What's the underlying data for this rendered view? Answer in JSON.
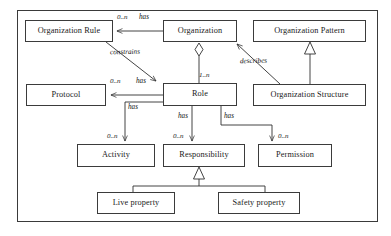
{
  "diagram": {
    "frame": {
      "stroke": "#3a3a3a"
    },
    "node_stroke": "#3b3b3b",
    "text_color": "#1a1a1a",
    "nodes": [
      {
        "id": "organization-rule",
        "label": "Organization Rule"
      },
      {
        "id": "organization",
        "label": "Organization"
      },
      {
        "id": "organization-pattern",
        "label": "Organization Pattern"
      },
      {
        "id": "protocol",
        "label": "Protocol"
      },
      {
        "id": "role",
        "label": "Role"
      },
      {
        "id": "organization-structure",
        "label": "Organization Structure"
      },
      {
        "id": "activity",
        "label": "Activity"
      },
      {
        "id": "responsibility",
        "label": "Responsibility"
      },
      {
        "id": "permission",
        "label": "Permission"
      },
      {
        "id": "live-property",
        "label": "Live property"
      },
      {
        "id": "safety-property",
        "label": "Safety property"
      }
    ],
    "edges": [
      {
        "id": "organization-has-organization-rule",
        "from": "organization",
        "to": "organization-rule",
        "label": "has",
        "multiplicity": "0..n",
        "kind": "association"
      },
      {
        "id": "organization-rule-constrains-role",
        "from": "organization-rule",
        "to": "role",
        "label": "constrains",
        "multiplicity": "",
        "kind": "association"
      },
      {
        "id": "organization-aggregates-role",
        "from": "organization",
        "to": "role",
        "label": "",
        "multiplicity": "1..n",
        "kind": "aggregation"
      },
      {
        "id": "role-has-protocol",
        "from": "role",
        "to": "protocol",
        "label": "has",
        "multiplicity": "0..n",
        "kind": "association"
      },
      {
        "id": "role-has-activity",
        "from": "role",
        "to": "activity",
        "label": "has",
        "multiplicity": "0..n",
        "kind": "association"
      },
      {
        "id": "role-has-responsibility",
        "from": "role",
        "to": "responsibility",
        "label": "has",
        "multiplicity": "0..n",
        "kind": "association"
      },
      {
        "id": "role-has-permission",
        "from": "role",
        "to": "permission",
        "label": "has",
        "multiplicity": "0..n",
        "kind": "association"
      },
      {
        "id": "organization-structure-describes-organization",
        "from": "organization-structure",
        "to": "organization",
        "label": "describes",
        "multiplicity": "",
        "kind": "association"
      },
      {
        "id": "organization-structure-inherits-organization-pattern",
        "from": "organization-structure",
        "to": "organization-pattern",
        "label": "",
        "multiplicity": "",
        "kind": "generalization"
      },
      {
        "id": "live-property-inherits-responsibility",
        "from": "live-property",
        "to": "responsibility",
        "label": "",
        "multiplicity": "",
        "kind": "generalization"
      },
      {
        "id": "safety-property-inherits-responsibility",
        "from": "safety-property",
        "to": "responsibility",
        "label": "",
        "multiplicity": "",
        "kind": "generalization"
      }
    ],
    "labels": {
      "has_1": "has",
      "has_2": "has",
      "has_3": "has",
      "has_4": "has",
      "has_5": "has",
      "constrains": "constrains",
      "describes": "describes",
      "mult_rule": "0..n",
      "mult_protocol": "0..n",
      "mult_role": "1..n",
      "mult_activity": "0..n",
      "mult_responsibility": "0..n",
      "mult_permission": "0..n"
    }
  }
}
